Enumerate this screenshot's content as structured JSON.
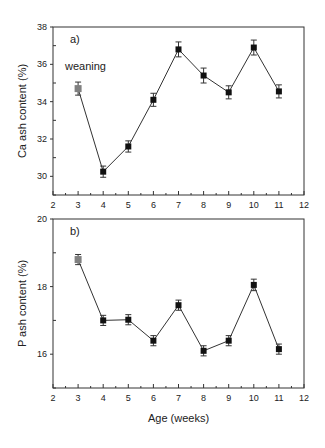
{
  "chart_data": [
    {
      "type": "line",
      "panel_label": "a)",
      "annotation": "weaning",
      "title": "",
      "xlabel": "",
      "ylabel": "Ca ash content (%)",
      "xlim": [
        2,
        12
      ],
      "ylim": [
        29,
        38
      ],
      "xticks": [
        2,
        3,
        4,
        5,
        6,
        7,
        8,
        9,
        10,
        11,
        12
      ],
      "yticks": [
        30,
        32,
        34,
        36,
        38
      ],
      "x": [
        3,
        4,
        5,
        6,
        7,
        8,
        9,
        10,
        11
      ],
      "series": [
        {
          "name": "Ca ash content",
          "values": [
            34.7,
            30.25,
            31.6,
            34.1,
            36.8,
            35.4,
            34.5,
            36.9,
            34.55
          ],
          "errors": [
            0.35,
            0.3,
            0.3,
            0.35,
            0.4,
            0.4,
            0.35,
            0.4,
            0.35
          ]
        }
      ],
      "highlight_point": {
        "x": 3,
        "color": "#808080",
        "note": "weaning"
      },
      "grid": false,
      "legend": "none"
    },
    {
      "type": "line",
      "panel_label": "b)",
      "title": "",
      "xlabel": "Age (weeks)",
      "ylabel": "P ash content (%)",
      "xlim": [
        2,
        12
      ],
      "ylim": [
        15,
        20
      ],
      "xticks": [
        2,
        3,
        4,
        5,
        6,
        7,
        8,
        9,
        10,
        11,
        12
      ],
      "yticks": [
        16,
        18,
        20
      ],
      "x": [
        3,
        4,
        5,
        6,
        7,
        8,
        9,
        10,
        11
      ],
      "series": [
        {
          "name": "P ash content",
          "values": [
            18.8,
            17.0,
            17.02,
            16.4,
            17.45,
            16.1,
            16.4,
            18.05,
            16.15
          ],
          "errors": [
            0.15,
            0.15,
            0.15,
            0.15,
            0.15,
            0.15,
            0.15,
            0.17,
            0.15
          ]
        }
      ],
      "highlight_point": {
        "x": 3,
        "color": "#808080"
      },
      "grid": false,
      "legend": "none"
    }
  ],
  "colors": {
    "marker": "#111111",
    "highlight": "#808080",
    "line": "#333333",
    "axis": "#333333"
  }
}
